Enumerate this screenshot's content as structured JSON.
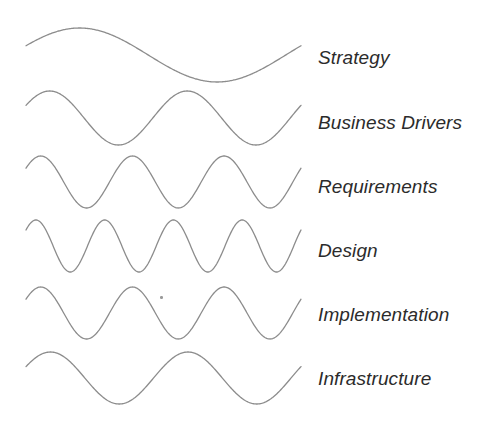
{
  "diagram": {
    "width": 492,
    "height": 427,
    "background_color": "#ffffff",
    "line_color": "#8c8c8c",
    "line_width": 1.3,
    "label_color": "#2b2b2b",
    "label_font_size": 19,
    "label_style": "italic",
    "wave_x_start": 26,
    "wave_x_end": 301,
    "label_x": 318,
    "layers": [
      {
        "label": "Strategy",
        "cycles": 1,
        "center_y": 55,
        "amplitude": 27,
        "phase_deg": 20,
        "label_center_y": 57
      },
      {
        "label": "Business Drivers",
        "cycles": 2,
        "center_y": 118,
        "amplitude": 27,
        "phase_deg": 28,
        "label_center_y": 122
      },
      {
        "label": "Requirements",
        "cycles": 3,
        "center_y": 182,
        "amplitude": 26,
        "phase_deg": 32,
        "label_center_y": 186
      },
      {
        "label": "Design",
        "cycles": 4,
        "center_y": 246,
        "amplitude": 26,
        "phase_deg": 38,
        "label_center_y": 250
      },
      {
        "label": "Implementation",
        "cycles": 3,
        "center_y": 313,
        "amplitude": 26,
        "phase_deg": 32,
        "label_center_y": 314
      },
      {
        "label": "Infrastructure",
        "cycles": 2,
        "center_y": 378,
        "amplitude": 26,
        "phase_deg": 26,
        "label_center_y": 378
      }
    ],
    "artifacts": [
      {
        "name": "scan-speck",
        "x": 160,
        "y": 296,
        "w": 3,
        "h": 3
      }
    ]
  },
  "chart_data": {
    "type": "line",
    "xlabel": "",
    "ylabel": "",
    "grid": false,
    "legend_position": "right",
    "annotation": "Each row is a sine wave whose frequency increases from Strategy down to Design, then decreases again through Infrastructure.",
    "series": [
      {
        "name": "Strategy",
        "cycles": 1,
        "amplitude": 27
      },
      {
        "name": "Business Drivers",
        "cycles": 2,
        "amplitude": 27
      },
      {
        "name": "Requirements",
        "cycles": 3,
        "amplitude": 26
      },
      {
        "name": "Design",
        "cycles": 4,
        "amplitude": 26
      },
      {
        "name": "Implementation",
        "cycles": 3,
        "amplitude": 26
      },
      {
        "name": "Infrastructure",
        "cycles": 2,
        "amplitude": 26
      }
    ],
    "categories": [
      "Strategy",
      "Business Drivers",
      "Requirements",
      "Design",
      "Implementation",
      "Infrastructure"
    ],
    "values": [
      1,
      2,
      3,
      4,
      3,
      2
    ]
  }
}
